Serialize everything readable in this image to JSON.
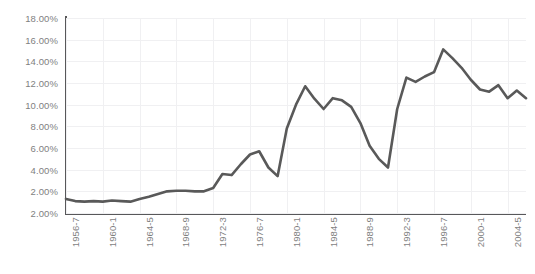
{
  "chart_data": {
    "type": "line",
    "title": "",
    "subtitle": "",
    "xlabel": "",
    "ylabel": "",
    "grid": true,
    "legend": "none",
    "line_color": "#595959",
    "axis_color": "#58585a",
    "gridline_color": "#f0f0f2",
    "tick_label_color": "#7f7f7f",
    "ylim": [
      2.0,
      18.0
    ],
    "y_tick_labels": [
      "18.00%",
      "16.00%",
      "14.00%",
      "12.00%",
      "10.00%",
      "8.00%",
      "6.00%",
      "4.00%",
      "2.00%",
      "2.00%"
    ],
    "y_tick_values": [
      18.0,
      16.0,
      14.0,
      12.0,
      10.0,
      8.0,
      6.0,
      4.0,
      2.0,
      2.0
    ],
    "x_tick_labels": [
      "1956-7",
      "1960-1",
      "1964-5",
      "1968-9",
      "1972-3",
      "1976-7",
      "1980-1",
      "1984-5",
      "1988-9",
      "1992-3",
      "1996-7",
      "2000-1",
      "2004-5"
    ],
    "categories": [
      "1956-7",
      "1957-8",
      "1958-9",
      "1959-60",
      "1960-1",
      "1961-2",
      "1962-3",
      "1963-4",
      "1964-5",
      "1965-6",
      "1966-7",
      "1967-8",
      "1968-9",
      "1969-70",
      "1970-1",
      "1971-2",
      "1972-3",
      "1973-4",
      "1974-5",
      "1975-6",
      "1976-7",
      "1977-8",
      "1978-9",
      "1979-80",
      "1980-1",
      "1981-2",
      "1982-3",
      "1983-4",
      "1984-5",
      "1985-6",
      "1986-7",
      "1987-8",
      "1988-9",
      "1989-90",
      "1990-1",
      "1991-2",
      "1992-3",
      "1993-4",
      "1994-5",
      "1995-6",
      "1996-7",
      "1997-8",
      "1998-9",
      "1999-2000",
      "2000-1",
      "2001-2",
      "2002-3",
      "2003-4",
      "2004-5",
      "2005-6",
      "2006-7"
    ],
    "values": [
      1.3,
      1.1,
      1.05,
      1.1,
      1.05,
      1.15,
      1.1,
      1.05,
      1.3,
      1.5,
      1.75,
      2.0,
      2.05,
      2.05,
      2.0,
      2.0,
      2.3,
      3.6,
      3.5,
      4.5,
      5.4,
      5.7,
      4.2,
      3.4,
      7.8,
      10.0,
      11.7,
      10.55,
      9.6,
      10.6,
      10.4,
      9.8,
      8.3,
      6.2,
      5.0,
      4.2,
      9.6,
      12.5,
      12.1,
      12.6,
      13.0,
      15.1,
      14.3,
      13.4,
      12.3,
      11.4,
      11.2,
      11.8,
      10.6,
      11.3,
      10.6
    ],
    "series_name": "rate"
  }
}
